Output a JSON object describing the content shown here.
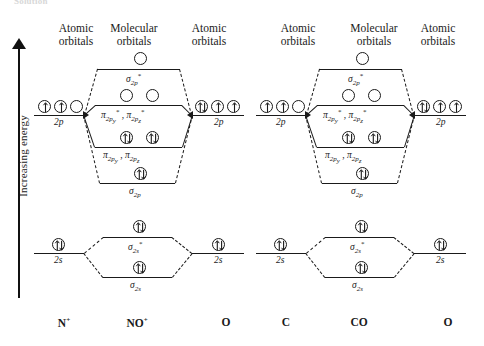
{
  "caption": {
    "cut_off_text": "Solution"
  },
  "axis": {
    "label": "Increasing energy",
    "direction": "up"
  },
  "headers": {
    "atomic": "Atomic\norbitals",
    "atomic_line1": "Atomic",
    "atomic_line2": "orbitals",
    "molecular_line1": "Molecular",
    "molecular_line2": "orbitals"
  },
  "labels": {
    "two_p": "2p",
    "two_s": "2s",
    "sigma_2p_star": "σ2p*",
    "sigma_2p": "σ2p",
    "pi_star": "π2py* , π2pz*",
    "pi_bond": "π2py , π2pz",
    "sigma_2s_star": "σ2s*",
    "sigma_2s": "σ2s"
  },
  "diagrams": [
    {
      "id": "no-plus",
      "left_atom": "N+",
      "molecule": "NO+",
      "right_atom": "O",
      "left_2p_occupancy": [
        "up",
        "up",
        "empty"
      ],
      "right_2p_occupancy": [
        "pair",
        "up",
        "up"
      ],
      "mo_occupancy": {
        "sigma_2p_star": [
          "empty"
        ],
        "pi_star": [
          "empty",
          "empty"
        ],
        "pi_bond": [
          "pair",
          "pair"
        ],
        "sigma_2p": [
          "pair"
        ],
        "sigma_2s_star": [
          "pair"
        ],
        "sigma_2s": [
          "pair"
        ]
      },
      "left_2s_occupancy": [
        "pair"
      ],
      "right_2s_occupancy": [
        "pair"
      ]
    },
    {
      "id": "co",
      "left_atom": "C",
      "molecule": "CO",
      "right_atom": "O",
      "left_2p_occupancy": [
        "up",
        "up",
        "empty"
      ],
      "right_2p_occupancy": [
        "pair",
        "up",
        "up"
      ],
      "mo_occupancy": {
        "sigma_2p_star": [
          "empty"
        ],
        "pi_star": [
          "empty",
          "empty"
        ],
        "pi_bond": [
          "pair",
          "pair"
        ],
        "sigma_2p": [
          "pair"
        ],
        "sigma_2s_star": [
          "pair"
        ],
        "sigma_2s": [
          "pair"
        ]
      },
      "left_2s_occupancy": [
        "pair"
      ],
      "right_2s_occupancy": [
        "pair"
      ]
    }
  ],
  "colors": {
    "ink": "#1a1a1a",
    "background": "#ffffff"
  }
}
